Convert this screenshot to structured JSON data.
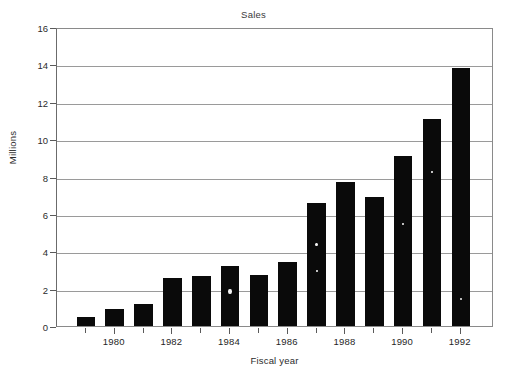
{
  "chart_data": {
    "type": "bar",
    "title": "Sales",
    "xlabel": "Fiscal year",
    "ylabel": "Millions",
    "categories": [
      1979,
      1980,
      1981,
      1982,
      1983,
      1984,
      1985,
      1986,
      1987,
      1988,
      1989,
      1990,
      1991,
      1992
    ],
    "values": [
      0.5,
      0.9,
      1.2,
      2.55,
      2.7,
      3.2,
      2.75,
      3.4,
      6.6,
      7.7,
      6.9,
      9.1,
      11.1,
      13.8
    ],
    "xtick_labels": [
      "1980",
      "1982",
      "1984",
      "1986",
      "1988",
      "1990",
      "1992"
    ],
    "xtick_values": [
      1980,
      1982,
      1984,
      1986,
      1988,
      1990,
      1992
    ],
    "ytick_labels": [
      "0",
      "2",
      "4",
      "6",
      "8",
      "10",
      "12",
      "14",
      "16"
    ],
    "ytick_values": [
      0,
      2,
      4,
      6,
      8,
      10,
      12,
      14,
      16
    ],
    "ylim": [
      0,
      16
    ],
    "grid": true,
    "legend": false,
    "bar_color": "#0a0a0a",
    "grid_color": "#9a9a9a",
    "axis_color": "#6b6b6b",
    "background_color": "#ffffff"
  }
}
